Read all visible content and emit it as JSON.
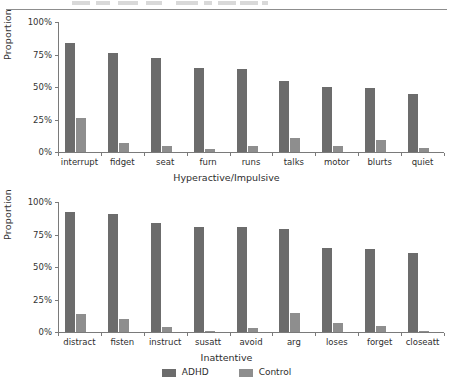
{
  "figure": {
    "ylabel": "Proportion",
    "y_ticks": [
      "0%",
      "25%",
      "50%",
      "75%",
      "100%"
    ],
    "legend": [
      {
        "key": "adhd",
        "label": "ADHD",
        "color": "#6c6c6c"
      },
      {
        "key": "control",
        "label": "Control",
        "color": "#8e8e8e"
      }
    ]
  },
  "chart_data": [
    {
      "type": "bar",
      "title": "",
      "xlabel": "Hyperactive/Impulsive",
      "ylabel": "Proportion",
      "ylim": [
        0,
        100
      ],
      "yticks": [
        0,
        25,
        50,
        75,
        100
      ],
      "ytick_labels": [
        "0%",
        "25%",
        "50%",
        "75%",
        "100%"
      ],
      "grid": false,
      "legend_position": "bottom-center",
      "categories": [
        "interrupt",
        "fidget",
        "seat",
        "furn",
        "runs",
        "talks",
        "motor",
        "blurts",
        "quiet"
      ],
      "series": [
        {
          "name": "ADHD",
          "color": "#6c6c6c",
          "values": [
            84,
            76,
            72,
            65,
            64,
            55,
            50,
            49,
            45
          ]
        },
        {
          "name": "Control",
          "color": "#8e8e8e",
          "values": [
            26,
            7,
            5,
            2,
            5,
            11,
            5,
            9,
            3
          ]
        }
      ]
    },
    {
      "type": "bar",
      "title": "",
      "xlabel": "Inattentive",
      "ylabel": "Proportion",
      "ylim": [
        0,
        100
      ],
      "yticks": [
        0,
        25,
        50,
        75,
        100
      ],
      "ytick_labels": [
        "0%",
        "25%",
        "50%",
        "75%",
        "100%"
      ],
      "grid": false,
      "legend_position": "bottom-center",
      "categories": [
        "distract",
        "fisten",
        "instruct",
        "susatt",
        "avoid",
        "arg",
        "loses",
        "forget",
        "closeatt"
      ],
      "series": [
        {
          "name": "ADHD",
          "color": "#6c6c6c",
          "values": [
            92,
            91,
            84,
            81,
            81,
            79,
            65,
            64,
            61
          ]
        },
        {
          "name": "Control",
          "color": "#8e8e8e",
          "values": [
            14,
            10,
            4,
            1,
            3,
            15,
            7,
            5,
            1
          ]
        }
      ]
    }
  ]
}
